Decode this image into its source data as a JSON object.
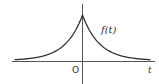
{
  "diagram": {
    "title": "",
    "function_label": "f(t)",
    "x_axis_label": "t",
    "origin_label": "O",
    "curve": {
      "description": "two-sided decaying exponential, peak (cusp) at t = 0",
      "formula_shape": "exp(-|t|)",
      "color": "#333333"
    },
    "axes_color": "#555555"
  },
  "chart_data": {
    "type": "line",
    "title": "",
    "xlabel": "t",
    "ylabel": "f(t)",
    "x": [
      -4,
      -3,
      -2,
      -1,
      -0.5,
      0,
      0.5,
      1,
      2,
      3,
      4
    ],
    "series": [
      {
        "name": "f(t)",
        "values": [
          0.018,
          0.05,
          0.135,
          0.368,
          0.607,
          1.0,
          0.607,
          0.368,
          0.135,
          0.05,
          0.018
        ]
      }
    ],
    "grid": false,
    "legend": "none",
    "annotations": [
      "f(t)",
      "O",
      "t"
    ]
  }
}
